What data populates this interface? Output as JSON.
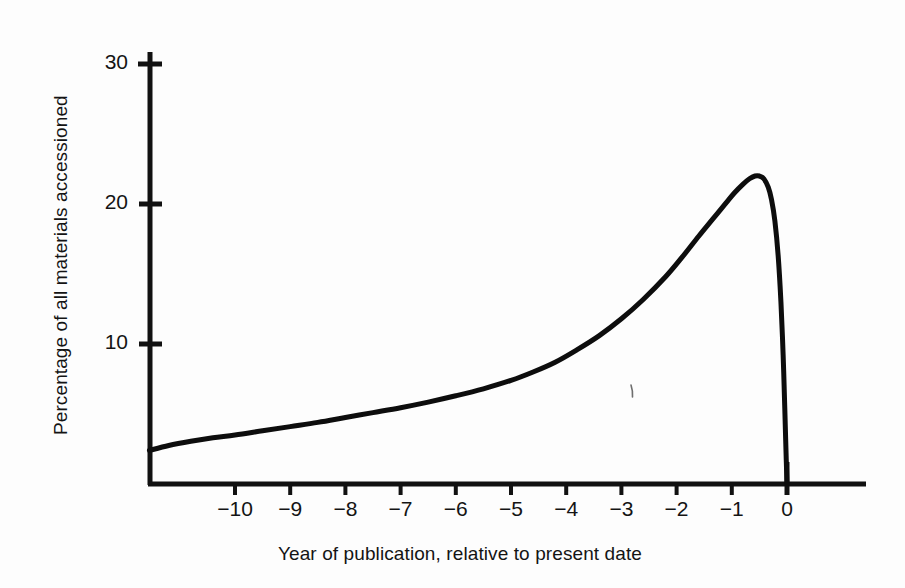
{
  "chart_data": {
    "type": "line",
    "title": "",
    "subtitle": "",
    "xlabel": "Year of publication, relative to present date",
    "ylabel": "Percentage of all materials accessioned",
    "xlim": [
      -11.6,
      1.4
    ],
    "ylim": [
      0,
      30
    ],
    "grid": false,
    "legend": null,
    "xticks": [
      -10,
      -9,
      -8,
      -7,
      -6,
      -5,
      -4,
      -3,
      -2,
      -1,
      0
    ],
    "xtick_labels": [
      "−10",
      "−9",
      "−8",
      "−7",
      "−6",
      "−5",
      "−4",
      "−3",
      "−2",
      "−1",
      "0"
    ],
    "yticks": [
      10,
      20,
      30
    ],
    "ytick_labels": [
      "10",
      "20",
      "30"
    ],
    "series": [
      {
        "name": "Percentage of all materials accessioned",
        "color": "#0d0d0d",
        "linewidth": 5,
        "x": [
          -11.55,
          -11.2,
          -10.8,
          -10.4,
          -10.0,
          -9.5,
          -9.0,
          -8.5,
          -8.0,
          -7.5,
          -7.0,
          -6.5,
          -6.0,
          -5.5,
          -5.0,
          -4.6,
          -4.2,
          -3.8,
          -3.4,
          -3.0,
          -2.6,
          -2.2,
          -1.9,
          -1.6,
          -1.35,
          -1.1,
          -0.95,
          -0.8,
          -0.68,
          -0.58,
          -0.5,
          -0.42,
          -0.34,
          -0.28,
          -0.22,
          -0.16,
          -0.11,
          -0.07,
          -0.04,
          -0.02,
          0.0
        ],
        "y": [
          2.4,
          2.75,
          3.05,
          3.3,
          3.5,
          3.8,
          4.1,
          4.4,
          4.75,
          5.1,
          5.45,
          5.85,
          6.3,
          6.8,
          7.4,
          8.0,
          8.7,
          9.6,
          10.6,
          11.8,
          13.2,
          14.8,
          16.2,
          17.7,
          18.9,
          20.1,
          20.8,
          21.4,
          21.8,
          22.0,
          22.0,
          21.8,
          21.2,
          20.3,
          18.8,
          16.3,
          13.0,
          9.2,
          5.4,
          2.6,
          0.0
        ]
      }
    ],
    "axis_color": "#111111",
    "background_color": "#fdfdfd"
  },
  "axes": {
    "x_title": "Year of publication, relative to present date",
    "y_title": "Percentage of all materials accessioned"
  },
  "ticks": {
    "y": [
      {
        "label": "30",
        "value": 30
      },
      {
        "label": "20",
        "value": 20
      },
      {
        "label": "10",
        "value": 10
      }
    ],
    "x": [
      {
        "label": "−10",
        "value": -10
      },
      {
        "label": "−9",
        "value": -9
      },
      {
        "label": "−8",
        "value": -8
      },
      {
        "label": "−7",
        "value": -7
      },
      {
        "label": "−6",
        "value": -6
      },
      {
        "label": "−5",
        "value": -5
      },
      {
        "label": "−4",
        "value": -4
      },
      {
        "label": "−3",
        "value": -3
      },
      {
        "label": "−2",
        "value": -2
      },
      {
        "label": "−1",
        "value": -1
      },
      {
        "label": "0",
        "value": 0
      }
    ]
  }
}
